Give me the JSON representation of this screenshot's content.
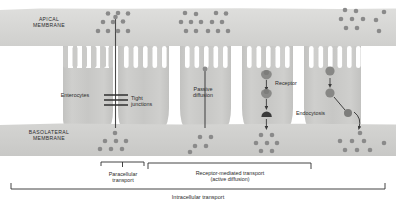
{
  "figure": {
    "type": "biological-diagram",
    "canvas": {
      "width": 396,
      "height": 208,
      "background": "#ffffff"
    },
    "colors": {
      "apical_membrane": "#d8d8d6",
      "basolateral_membrane": "#d2d2d0",
      "cell_body": "#c6c6c4",
      "cell_body_light": "#d0d0ce",
      "microvilli": "#c9c9c7",
      "particle": "#8c8c8c",
      "particle_dark": "#7a7a7a",
      "receptor": "#8a8a88",
      "text": "#2b2b2b",
      "line": "#3a3a3a",
      "lumen_gap": "#ffffff"
    }
  },
  "labels": {
    "apical_membrane": "APICAL\nMEMBRANE",
    "basolateral_membrane": "BASOLATERAL\nMEMBRANE",
    "enterocytes": "Enterocytes",
    "tight_junctions": "Tight\njunctions",
    "passive_diffusion": "Passive\ndiffusion",
    "receptor": "Receptor",
    "endocytosis": "Endocytosis",
    "paracellular_transport": "Paracellular\ntransport",
    "receptor_mediated_transport": "Receptor-mediated transport\n(active diffusion)",
    "intracellular_transport": "Intracellular transport"
  },
  "structures": {
    "apical_membrane_band": {
      "x": 0,
      "y": 8,
      "width": 396,
      "height": 38
    },
    "basolateral_membrane_band": {
      "x": 0,
      "y": 123,
      "width": 396,
      "height": 33
    },
    "cell_count": 5,
    "microvilli_per_cell": 5,
    "tight_junction_bars": 3
  },
  "brackets": {
    "paracellular": {
      "x1": 101,
      "x2": 144,
      "y": 163,
      "label_x": 122
    },
    "receptor_mediated": {
      "x1": 148,
      "x2": 311,
      "y": 163,
      "label_x": 230
    },
    "intracellular": {
      "x1": 11,
      "x2": 385,
      "y": 188,
      "label_x": 198
    }
  },
  "pathways": [
    {
      "name": "paracellular",
      "description": "particles pass between adjacent enterocytes through tight junctions"
    },
    {
      "name": "passive-diffusion",
      "description": "particle crosses through the cell body unaided"
    },
    {
      "name": "receptor-mediated",
      "description": "particle binds receptor, is carried through the cell, released basolaterally"
    },
    {
      "name": "endocytosis",
      "description": "vesicle engulfs particle, migrates and releases it basolaterally"
    }
  ]
}
